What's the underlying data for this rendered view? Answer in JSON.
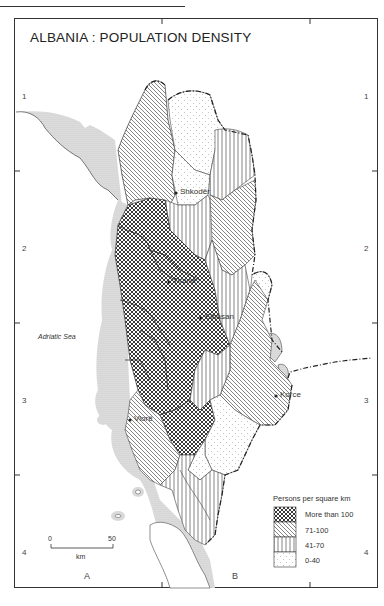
{
  "title": "ALBANIA : POPULATION DENSITY",
  "grid": {
    "rows_left": [
      "1",
      "2",
      "3",
      "4"
    ],
    "rows_right": [
      "1",
      "2",
      "3",
      "4"
    ],
    "columns": [
      "A",
      "B"
    ]
  },
  "sea_label": "Adriatic Sea",
  "cities": [
    {
      "name": "Shkodër"
    },
    {
      "name": "Tirana"
    },
    {
      "name": "Elbasan"
    },
    {
      "name": "Vlorë"
    },
    {
      "name": "Korce"
    }
  ],
  "legend": {
    "title": "Persons per square km",
    "items": [
      {
        "label": "More than 100",
        "pattern": "crosshatch"
      },
      {
        "label": "71-100",
        "pattern": "diagonal"
      },
      {
        "label": "41-70",
        "pattern": "vertical"
      },
      {
        "label": "0-40",
        "pattern": "dotted"
      }
    ]
  },
  "scale": {
    "start": "0",
    "end": "50",
    "unit": "km"
  }
}
